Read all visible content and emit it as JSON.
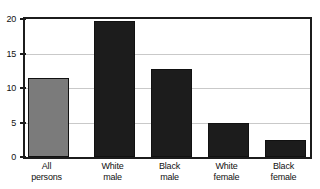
{
  "chart_data": {
    "type": "bar",
    "title": "",
    "subtitle": "",
    "xlabel": "",
    "ylabel": "",
    "categories": [
      "All persons",
      "White male",
      "Black male",
      "White female",
      "Black female"
    ],
    "category_lines": [
      [
        "All",
        "persons"
      ],
      [
        "White",
        "male"
      ],
      [
        "Black",
        "male"
      ],
      [
        "White",
        "female"
      ],
      [
        "Black",
        "female"
      ]
    ],
    "values": [
      11.5,
      19.7,
      12.7,
      5.0,
      2.5
    ],
    "bar_styles": [
      "light",
      "dark",
      "dark",
      "dark",
      "dark"
    ],
    "ylim": [
      0,
      20
    ],
    "yticks": [
      0,
      5,
      10,
      15,
      20
    ],
    "ytick_labels": [
      "0",
      "5",
      "10",
      "15",
      "20"
    ],
    "grid": true,
    "legend": "none",
    "colors": {
      "bar_light": "#7b7b7b",
      "bar_dark": "#1c1c1c",
      "axis": "#1c1c1c",
      "grid": "#c9c9c9",
      "background": "#ffffff",
      "text": "#111111"
    }
  }
}
